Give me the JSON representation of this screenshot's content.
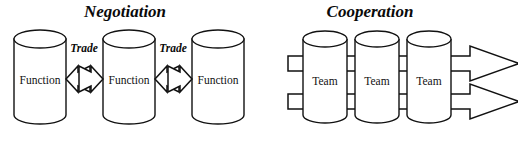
{
  "figure": {
    "width": 518,
    "height": 143,
    "background": "#ffffff",
    "stroke_color": "#111111",
    "text_color": "#0a0a0a"
  },
  "panels": [
    {
      "id": "negotiation",
      "title": "Negotiation",
      "title_x": 125,
      "title_y": 17,
      "nodes": [
        {
          "label": "Function",
          "cx": 40,
          "cy": 80
        },
        {
          "label": "Function",
          "cx": 129,
          "cy": 80
        },
        {
          "label": "Function",
          "cx": 218,
          "cy": 80
        }
      ],
      "connectors": [
        {
          "label": "Trade",
          "label_x": 84,
          "label_y": 52,
          "cx": 84,
          "cy": 79
        },
        {
          "label": "Trade",
          "label_x": 173,
          "label_y": 52,
          "cx": 173,
          "cy": 79
        }
      ]
    },
    {
      "id": "cooperation",
      "title": "Cooperation",
      "title_x": 370,
      "title_y": 17,
      "nodes": [
        {
          "label": "Team",
          "cx": 325,
          "cy": 80
        },
        {
          "label": "Team",
          "cx": 377,
          "cy": 80
        },
        {
          "label": "Team",
          "cx": 429,
          "cy": 80
        }
      ],
      "flows": [
        {
          "id": "upper-flow",
          "y": 63,
          "x_start": 288,
          "x_tip": 519
        },
        {
          "id": "lower-flow",
          "y": 101,
          "x_start": 288,
          "x_tip": 519
        }
      ]
    }
  ],
  "geometry": {
    "cylinder": {
      "rx": 26,
      "ry": 9,
      "height": 94,
      "top_y": 30
    },
    "team_cylinder": {
      "rx": 22,
      "ry": 8,
      "height": 92,
      "top_y": 31
    }
  }
}
